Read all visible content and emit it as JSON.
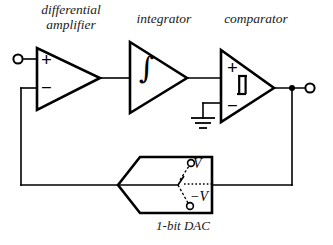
{
  "figure": {
    "type": "circuit-schematic",
    "background_color": "#ffffff",
    "line_color": "#000000"
  },
  "labels": {
    "differential_amplifier": "differential\namplifier",
    "differential_amplifier_line1": "differential",
    "differential_amplifier_line2": "amplifier",
    "integrator": "integrator",
    "comparator": "comparator",
    "dac": "1-bit DAC"
  },
  "symbols": {
    "plus_diff": "+",
    "minus_diff": "−",
    "plus_comp": "+",
    "minus_comp": "−",
    "integral": "∫",
    "v_positive": "V",
    "v_negative": "−V"
  },
  "blocks": [
    {
      "name": "differential-amplifier",
      "shape": "triangle",
      "inputs": [
        "+",
        "−"
      ],
      "label": "differential amplifier"
    },
    {
      "name": "integrator",
      "shape": "triangle",
      "inner_symbol": "∫",
      "label": "integrator"
    },
    {
      "name": "comparator",
      "shape": "triangle",
      "inner_symbol": "hysteresis",
      "inputs": [
        "+",
        "−"
      ],
      "label": "comparator"
    },
    {
      "name": "1-bit-dac",
      "shape": "hexagon-arrow-left",
      "inner_symbol": "spdt-switch",
      "terminals": [
        "V",
        "−V"
      ],
      "label": "1-bit DAC"
    }
  ],
  "terminals": [
    {
      "name": "input-terminal",
      "style": "open-circle",
      "position": "left"
    },
    {
      "name": "output-terminal",
      "style": "open-circle",
      "position": "right"
    },
    {
      "name": "v-positive-terminal",
      "style": "open-circle"
    },
    {
      "name": "v-negative-terminal",
      "style": "open-circle"
    }
  ],
  "nodes": [
    {
      "name": "output-junction",
      "style": "filled-dot"
    }
  ],
  "ground": {
    "name": "ground-symbol",
    "style": "three-bar-ground"
  }
}
